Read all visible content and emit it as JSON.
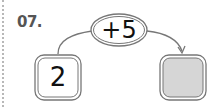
{
  "problem": {
    "number_label": "07.",
    "operation_label": "+5",
    "input_value": "2",
    "output_value": ""
  },
  "colors": {
    "stroke": "#666666",
    "answer_fill": "#d6d6d6",
    "text": "#111111",
    "dotted_margin": "#b8b8b8"
  }
}
